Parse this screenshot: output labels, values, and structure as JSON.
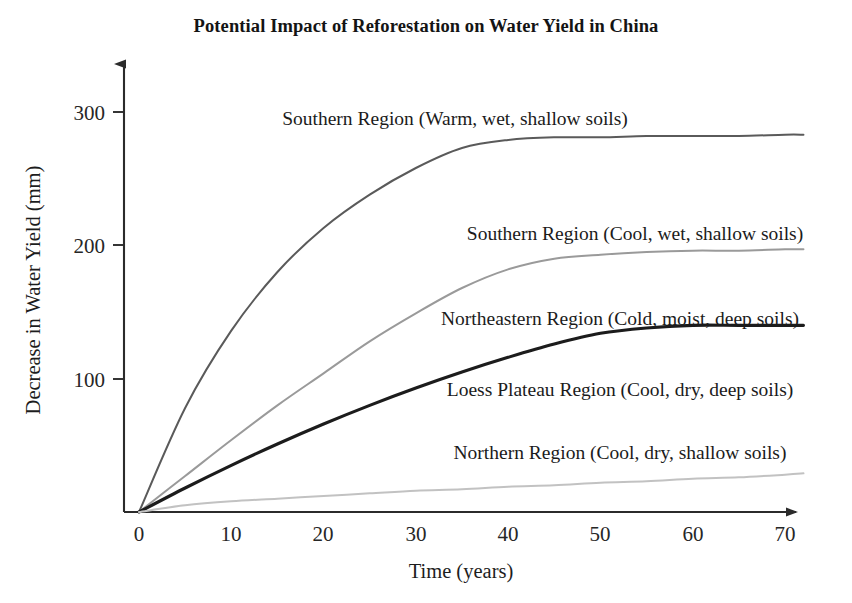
{
  "chart_data": {
    "type": "line",
    "title": "Potential Impact of Reforestation on Water Yield in China",
    "xlabel": "Time (years)",
    "ylabel": "Decrease in Water Yield (mm)",
    "xlim": [
      0,
      72
    ],
    "ylim": [
      0,
      330
    ],
    "xticks": [
      0,
      10,
      20,
      30,
      40,
      50,
      60,
      70
    ],
    "xtick_labels": [
      "0",
      "10",
      "20",
      "30",
      "40",
      "50",
      "60",
      "70"
    ],
    "yticks": [
      100,
      200,
      300
    ],
    "ytick_labels": [
      "100",
      "200",
      "300"
    ],
    "grid": false,
    "legend_position": "inline-above-each-curve",
    "x": [
      0,
      5,
      10,
      15,
      20,
      25,
      30,
      35,
      40,
      45,
      50,
      55,
      60,
      65,
      70,
      72
    ],
    "series": [
      {
        "name": "Southern Region (Warm, wet, shallow soils)",
        "color": "#5a5a5a",
        "width": 2.0,
        "plateau": 282,
        "knee_year": 35,
        "values": [
          0,
          78,
          136,
          180,
          213,
          238,
          258,
          273,
          279,
          281,
          281,
          282,
          282,
          282,
          283,
          283
        ]
      },
      {
        "name": "Southern Region (Cool, wet, shallow soils)",
        "color": "#9a9a9a",
        "width": 2.0,
        "plateau": 196,
        "knee_year": 36,
        "values": [
          0,
          27,
          54,
          80,
          104,
          128,
          149,
          168,
          182,
          190,
          193,
          195,
          196,
          196,
          197,
          197
        ]
      },
      {
        "name": "Northeastern Region (Cold, moist, deep soils)",
        "color": "#1c1c1c",
        "width": 3.1,
        "plateau": 140,
        "knee_year": 45,
        "values": [
          0,
          18,
          35,
          51,
          66,
          80,
          93,
          105,
          116,
          126,
          134,
          138,
          140,
          140,
          140,
          140
        ]
      },
      {
        "name": "Loess Plateau Region (Cool, dry, deep soils)",
        "color": "#1c1c1c",
        "width": 3.1,
        "plateau": 140,
        "knee_year": 45,
        "shared_with": "Northeastern Region (Cold, moist, deep soils)",
        "values": [
          0,
          18,
          35,
          51,
          66,
          80,
          93,
          105,
          116,
          126,
          134,
          138,
          140,
          140,
          140,
          140
        ]
      },
      {
        "name": "Northern Region (Cool, dry, shallow soils)",
        "color": "#c2c2c2",
        "width": 2.0,
        "plateau": 29,
        "knee_year": 72,
        "values": [
          0,
          5,
          8,
          10,
          12,
          14,
          16,
          17,
          19,
          20,
          22,
          23,
          25,
          26,
          28,
          29
        ]
      }
    ],
    "annotations": [
      {
        "text": "Southern Region (Warm, wet, shallow soils)",
        "x": 36,
        "y": 300
      },
      {
        "text": "Southern Region (Cool, wet, shallow soils)",
        "x": 37,
        "y": 213
      },
      {
        "text": "Northeastern Region (Cold, moist, deep soils)",
        "x": 34,
        "y": 152
      },
      {
        "text": "Loess Plateau Region (Cool, dry, deep soils)",
        "x": 35,
        "y": 102
      },
      {
        "text": "Northern Region (Cool, dry, shallow soils)",
        "x": 36,
        "y": 55
      }
    ]
  },
  "figure": {
    "title": "Potential Impact of Reforestation on Water Yield in China",
    "axis": {
      "x_title": "Time (years)",
      "y_title": "Decrease in Water Yield (mm)",
      "x_ticks": [
        "0",
        "10",
        "20",
        "30",
        "40",
        "50",
        "60",
        "70"
      ],
      "y_ticks": [
        "300",
        "200",
        "100"
      ]
    },
    "labels": [
      "Southern Region (Warm, wet, shallow soils)",
      "Southern Region (Cool, wet, shallow soils)",
      "Northeastern Region (Cold, moist, deep soils)",
      "Loess Plateau Region (Cool, dry, deep soils)",
      "Northern Region (Cool, dry, shallow soils)"
    ]
  }
}
